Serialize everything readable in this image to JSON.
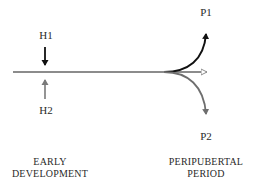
{
  "diagram": {
    "labels": {
      "h1": "H1",
      "h2": "H2",
      "p1": "P1",
      "p2": "P2"
    },
    "stages": {
      "early": {
        "line1": "EARLY",
        "line2": "DEVELOPMENT"
      },
      "peripubertal": {
        "line1": "PERIPUBERTAL",
        "line2": "PERIOD"
      }
    },
    "colors": {
      "timeline": "#8c8c8c",
      "h1_arrow": "#111111",
      "h2_arrow": "#7a7a7a",
      "p1_curve": "#111111",
      "p2_curve": "#6e6e6e",
      "text": "#2a2a2a"
    },
    "elements": [
      {
        "id": "timeline",
        "type": "arrow",
        "from": [
          13,
          72
        ],
        "to": [
          208,
          72
        ],
        "head": "open"
      },
      {
        "id": "h1-arrow",
        "type": "arrow",
        "from": [
          45,
          47
        ],
        "to": [
          45,
          66
        ],
        "direction": "down"
      },
      {
        "id": "h2-arrow",
        "type": "arrow",
        "from": [
          45,
          99
        ],
        "to": [
          45,
          79
        ],
        "direction": "up"
      },
      {
        "id": "p1-curve",
        "type": "curve",
        "from": [
          165,
          72
        ],
        "to": [
          206,
          32
        ],
        "direction": "up"
      },
      {
        "id": "p2-curve",
        "type": "curve",
        "from": [
          165,
          72
        ],
        "to": [
          206,
          116
        ],
        "direction": "down"
      }
    ]
  }
}
